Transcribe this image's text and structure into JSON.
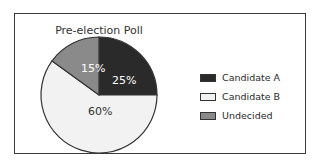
{
  "chart_data": {
    "type": "pie",
    "title": "Pre-election Poll",
    "categories": [
      "Candidate A",
      "Candidate B",
      "Undecided"
    ],
    "values": [
      25,
      60,
      15
    ],
    "labels": [
      "25%",
      "60%",
      "15%"
    ],
    "colors": [
      "#2a2a2a",
      "#f2f2f2",
      "#8a8a8a"
    ],
    "legend_position": "right"
  },
  "legend": [
    {
      "label": "Candidate A",
      "color": "#2a2a2a"
    },
    {
      "label": "Candidate B",
      "color": "#f2f2f2"
    },
    {
      "label": "Undecided",
      "color": "#8a8a8a"
    }
  ]
}
